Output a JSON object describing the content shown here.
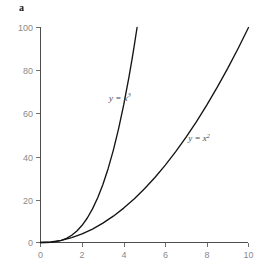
{
  "panel": {
    "label": "a"
  },
  "chart_data": {
    "type": "line",
    "title": "",
    "subtitle": "",
    "xlabel": "",
    "ylabel": "",
    "xlim": [
      0,
      10
    ],
    "ylim": [
      0,
      100
    ],
    "xticks": [
      "0",
      "2",
      "4",
      "6",
      "8",
      "10"
    ],
    "xtick_values": [
      0,
      2,
      4,
      6,
      8,
      10
    ],
    "yticks": [
      "0",
      "20",
      "40",
      "60",
      "80",
      "100"
    ],
    "ytick_values": [
      0,
      20,
      40,
      60,
      80,
      100
    ],
    "grid": false,
    "legend_position": "inline-annotation",
    "series": [
      {
        "name": "y = x3",
        "label_html": "y = x<sup>3</sup>",
        "label_lhs": "y = x",
        "label_exp": "3",
        "color": "#141414",
        "x": [
          0,
          0.25,
          0.5,
          0.75,
          1,
          1.25,
          1.5,
          1.75,
          2,
          2.25,
          2.5,
          2.75,
          3,
          3.25,
          3.5,
          3.75,
          4,
          4.25,
          4.4,
          4.5,
          4.642
        ],
        "values": [
          0,
          0.016,
          0.125,
          0.422,
          1,
          1.953,
          3.375,
          5.359,
          8,
          11.39,
          15.625,
          20.797,
          27,
          34.328,
          42.875,
          52.734,
          64,
          76.77,
          85.18,
          91.125,
          100
        ]
      },
      {
        "name": "y = x2",
        "label_html": "y = x<sup>2</sup>",
        "label_lhs": "y = x",
        "label_exp": "2",
        "color": "#141414",
        "x": [
          0,
          0.5,
          1,
          1.5,
          2,
          2.5,
          3,
          3.5,
          4,
          4.5,
          5,
          5.5,
          6,
          6.5,
          7,
          7.5,
          8,
          8.5,
          9,
          9.5,
          10
        ],
        "values": [
          0,
          0.25,
          1,
          2.25,
          4,
          6.25,
          9,
          12.25,
          16,
          20.25,
          25,
          30.25,
          36,
          42.25,
          49,
          56.25,
          64,
          72.25,
          81,
          90.25,
          100
        ]
      }
    ],
    "annotations": [
      {
        "text": "y = x3",
        "x_data": 3.3,
        "y_data": 66
      },
      {
        "text": "y = x2",
        "x_data": 7.1,
        "y_data": 47
      }
    ]
  }
}
